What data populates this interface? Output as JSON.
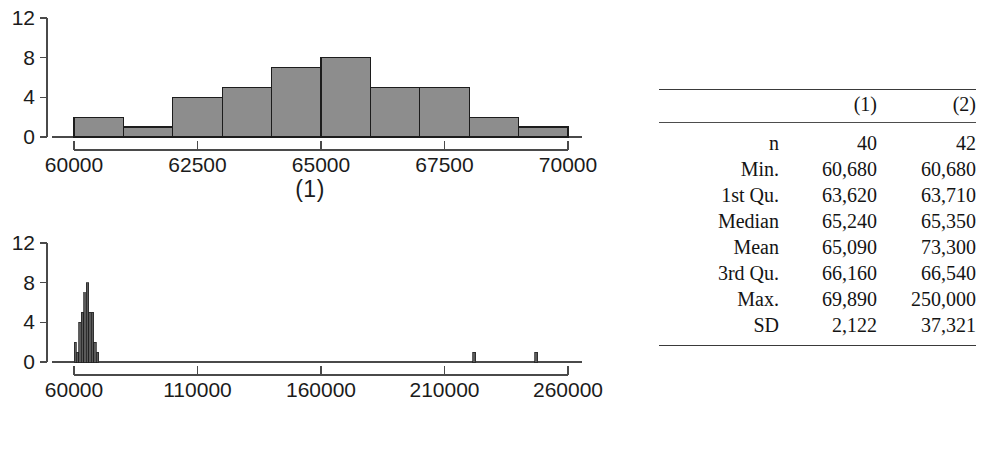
{
  "figure": {
    "panels": [
      {
        "caption": "(1)",
        "y_axis": {
          "ticks": [
            "0",
            "4",
            "8",
            "12"
          ],
          "values": [
            0,
            4,
            8,
            12
          ],
          "min": 0,
          "max": 12
        },
        "x_axis": {
          "ticks": [
            "60000",
            "62500",
            "65000",
            "67500",
            "70000"
          ],
          "values": [
            60000,
            62500,
            65000,
            67500,
            70000
          ],
          "min": 60000,
          "max": 70000
        }
      },
      {
        "caption": "(2)",
        "y_axis": {
          "ticks": [
            "0",
            "4",
            "8",
            "12"
          ],
          "values": [
            0,
            4,
            8,
            12
          ],
          "min": 0,
          "max": 12
        },
        "x_axis": {
          "ticks": [
            "60000",
            "110000",
            "160000",
            "210000",
            "260000"
          ],
          "values": [
            60000,
            110000,
            160000,
            210000,
            260000
          ],
          "min": 60000,
          "max": 260000
        }
      }
    ]
  },
  "chart_data": [
    {
      "type": "bar",
      "title": "(1)",
      "xlabel": "",
      "ylabel": "",
      "xlim": [
        60000,
        70000
      ],
      "ylim": [
        0,
        12
      ],
      "grid": false,
      "legend": null,
      "bin_width": 1000,
      "bin_edges": [
        60000,
        61000,
        62000,
        63000,
        64000,
        65000,
        66000,
        67000,
        68000,
        69000,
        70000
      ],
      "categories": [
        "60000-61000",
        "61000-62000",
        "62000-63000",
        "63000-64000",
        "64000-65000",
        "65000-66000",
        "66000-67000",
        "67000-68000",
        "68000-69000",
        "69000-70000"
      ],
      "values": [
        2,
        1,
        4,
        5,
        7,
        8,
        5,
        5,
        2,
        1
      ],
      "xticks": [
        60000,
        62500,
        65000,
        67500,
        70000
      ],
      "xticklabels": [
        "60000",
        "62500",
        "65000",
        "67500",
        "70000"
      ],
      "yticks": [
        0,
        4,
        8,
        12
      ],
      "yticklabels": [
        "0",
        "4",
        "8",
        "12"
      ]
    },
    {
      "type": "bar",
      "title": "(2)",
      "xlabel": "",
      "ylabel": "",
      "xlim": [
        60000,
        260000
      ],
      "ylim": [
        0,
        12
      ],
      "grid": false,
      "legend": null,
      "bin_width": 1000,
      "bin_edges": [
        60000,
        61000,
        62000,
        63000,
        64000,
        65000,
        66000,
        67000,
        68000,
        69000,
        70000
      ],
      "categories": [
        "60000-61000",
        "61000-62000",
        "62000-63000",
        "63000-64000",
        "64000-65000",
        "65000-66000",
        "66000-67000",
        "67000-68000",
        "68000-69000",
        "69000-70000"
      ],
      "values": [
        2,
        1,
        4,
        5,
        7,
        8,
        5,
        5,
        2,
        1
      ],
      "outlier_bins": [
        {
          "center": 222000,
          "value": 1
        },
        {
          "center": 247000,
          "value": 1
        }
      ],
      "xticks": [
        60000,
        110000,
        160000,
        210000,
        260000
      ],
      "xticklabels": [
        "60000",
        "110000",
        "160000",
        "210000",
        "260000"
      ],
      "yticks": [
        0,
        4,
        8,
        12
      ],
      "yticklabels": [
        "0",
        "4",
        "8",
        "12"
      ]
    },
    {
      "type": "table",
      "title": "",
      "columns": [
        "",
        "(1)",
        "(2)"
      ],
      "rows": [
        {
          "label": "n",
          "v1": "40",
          "v2": "42"
        },
        {
          "label": "Min.",
          "v1": "60,680",
          "v2": "60,680"
        },
        {
          "label": "1st Qu.",
          "v1": "63,620",
          "v2": "63,710"
        },
        {
          "label": "Median",
          "v1": "65,240",
          "v2": "65,350"
        },
        {
          "label": "Mean",
          "v1": "65,090",
          "v2": "73,300"
        },
        {
          "label": "3rd Qu.",
          "v1": "66,160",
          "v2": "66,540"
        },
        {
          "label": "Max.",
          "v1": "69,890",
          "v2": "250,000"
        },
        {
          "label": "SD",
          "v1": "2,122",
          "v2": "37,321"
        }
      ]
    }
  ],
  "table": {
    "col_header_blank": "",
    "col_header_1": "(1)",
    "col_header_2": "(2)",
    "rows": [
      {
        "label": "n",
        "v1": "40",
        "v2": "42"
      },
      {
        "label": "Min.",
        "v1": "60,680",
        "v2": "60,680"
      },
      {
        "label": "1st Qu.",
        "v1": "63,620",
        "v2": "63,710"
      },
      {
        "label": "Median",
        "v1": "65,240",
        "v2": "65,350"
      },
      {
        "label": "Mean",
        "v1": "65,090",
        "v2": "73,300"
      },
      {
        "label": "3rd Qu.",
        "v1": "66,160",
        "v2": "66,540"
      },
      {
        "label": "Max.",
        "v1": "69,890",
        "v2": "250,000"
      },
      {
        "label": "SD",
        "v1": "2,122",
        "v2": "37,321"
      }
    ]
  },
  "colors": {
    "bar_fill": "#8d8d8d",
    "bar_stroke": "#1c1c1c",
    "axis": "#4a4a4a",
    "text": "#1b1b1b",
    "rule": "#3a3a3a"
  }
}
